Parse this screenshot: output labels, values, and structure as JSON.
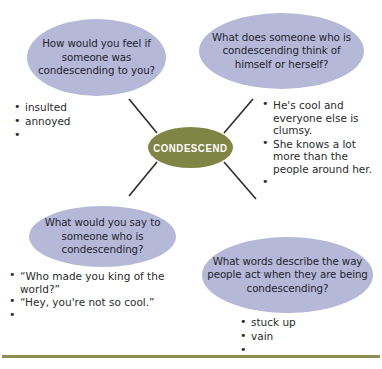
{
  "page": {
    "background_color": "#ffffff",
    "oval_color": "#b6b8d8",
    "center_color": "#7f8544",
    "rule_color": "#8a9051",
    "ink_color": "#2b2b2b"
  },
  "center": {
    "label": "CONDESCEND"
  },
  "branches": {
    "top_left": {
      "question": "How would you feel if someone was condescending to you?",
      "answers": [
        "insulted",
        "annoyed",
        ""
      ]
    },
    "top_right": {
      "question": "What does someone who is condescending think of himself or herself?",
      "answers": [
        "He's cool and everyone else is clumsy.",
        "She knows a lot more than the people around her.",
        ""
      ]
    },
    "bottom_left": {
      "question": "What would you say to someone who is condescending?",
      "answers": [
        "“Who made you king of the world?”",
        "“Hey, you're not so cool.”",
        ""
      ]
    },
    "bottom_right": {
      "question": "What words describe the way people act when they are being condescending?",
      "answers": [
        "stuck up",
        "vain",
        ""
      ]
    }
  }
}
